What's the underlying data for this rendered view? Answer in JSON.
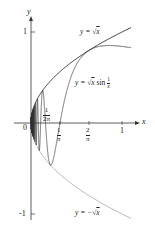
{
  "figure": {
    "axes": {
      "x_label": "x",
      "y_label": "y",
      "origin_label": "0",
      "y_ticks": [
        {
          "value": 1,
          "label": "1"
        },
        {
          "value": -1,
          "label": "-1"
        }
      ],
      "x_ticks": [
        {
          "value": 0.1592,
          "label_num": "1",
          "label_den": "2π"
        },
        {
          "value": 0.3183,
          "label_num": "1",
          "label_den": "π"
        },
        {
          "value": 0.6366,
          "label_num": "2",
          "label_den": "π"
        },
        {
          "value": 1,
          "label": "1"
        }
      ]
    },
    "curves": [
      {
        "name": "upper-envelope",
        "label_prefix": "y = ",
        "label_radicand": "x",
        "color": "#222222"
      },
      {
        "name": "oscillating",
        "label_prefix": "y = ",
        "label_radicand": "x",
        "label_suffix": " sin ",
        "frac_num": "1",
        "frac_den": "x",
        "color": "#333333"
      },
      {
        "name": "lower-envelope",
        "label_prefix": "y = −",
        "label_radicand": "x",
        "color": "#aaaaaa"
      }
    ]
  }
}
